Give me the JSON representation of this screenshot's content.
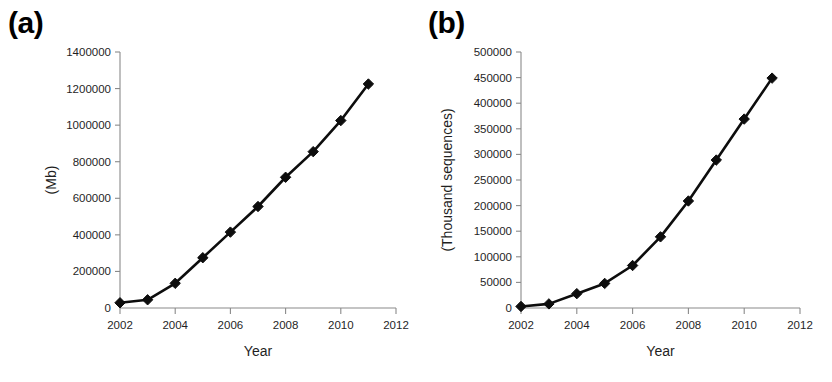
{
  "figure": {
    "background": "#ffffff",
    "series_color": "#111111",
    "axis_color": "#8a8a8a",
    "panels": [
      "a",
      "b"
    ]
  },
  "panel_a": {
    "label": "(a)",
    "chart_data": {
      "type": "line",
      "title": "",
      "xlabel": "Year",
      "ylabel": "(Mb)",
      "x": [
        2002,
        2003,
        2004,
        2005,
        2006,
        2007,
        2008,
        2009,
        2010,
        2011
      ],
      "values": [
        28500,
        45000,
        135000,
        275000,
        415000,
        555000,
        715000,
        855000,
        1025000,
        1225000
      ],
      "xlim": [
        2002,
        2012
      ],
      "ylim": [
        0,
        1400000
      ],
      "xticks": [
        2002,
        2004,
        2006,
        2008,
        2010,
        2012
      ],
      "xticklabels": [
        "2002",
        "2004",
        "2006",
        "2008",
        "2010",
        "2012"
      ],
      "yticks": [
        0,
        200000,
        400000,
        600000,
        800000,
        1000000,
        1200000,
        1400000
      ],
      "yticklabels": [
        "0",
        "200000",
        "400000",
        "600000",
        "800000",
        "1000000",
        "1200000",
        "1400000"
      ],
      "grid": false,
      "legend": "none",
      "marker": "diamond"
    }
  },
  "panel_b": {
    "label": "(b)",
    "chart_data": {
      "type": "line",
      "title": "",
      "xlabel": "Year",
      "ylabel": "(Thousand sequences)",
      "x": [
        2002,
        2003,
        2004,
        2005,
        2006,
        2007,
        2008,
        2009,
        2010,
        2011
      ],
      "values": [
        3000,
        8000,
        28000,
        48000,
        83000,
        139000,
        209000,
        289000,
        369000,
        449000
      ],
      "xlim": [
        2002,
        2012
      ],
      "ylim": [
        0,
        500000
      ],
      "xticks": [
        2002,
        2004,
        2006,
        2008,
        2010,
        2012
      ],
      "xticklabels": [
        "2002",
        "2004",
        "2006",
        "2008",
        "2010",
        "2012"
      ],
      "yticks": [
        0,
        50000,
        100000,
        150000,
        200000,
        250000,
        300000,
        350000,
        400000,
        450000,
        500000
      ],
      "yticklabels": [
        "0",
        "50000",
        "100000",
        "150000",
        "200000",
        "250000",
        "300000",
        "350000",
        "400000",
        "450000",
        "500000"
      ],
      "grid": false,
      "legend": "none",
      "marker": "diamond"
    }
  }
}
